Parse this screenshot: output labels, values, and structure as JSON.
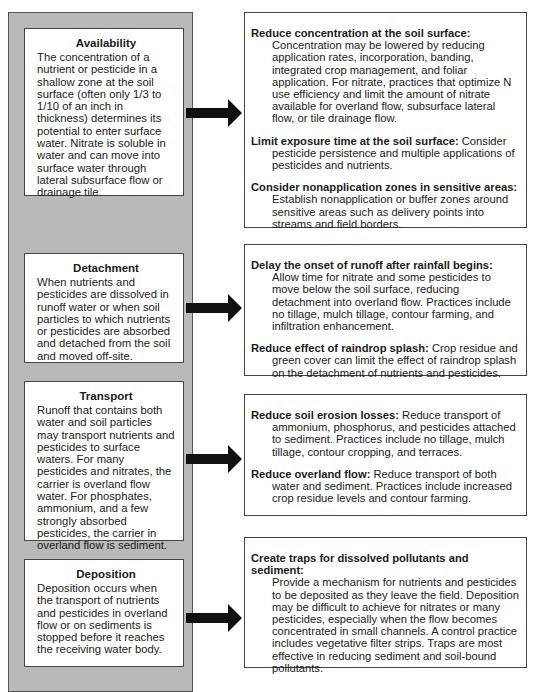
{
  "colors": {
    "column_gray": "#b9b9b9",
    "border": "#444444",
    "arrow": "#111111"
  },
  "left_boxes": [
    {
      "title": "Availability",
      "text": "The concentration of a nutrient or pesticide in a shallow zone at the soil surface (often only 1/3 to 1/10 of an inch in thickness) determines its potential to enter surface water. Nitrate is soluble in water and can move into surface water through lateral subsurface flow or drainage tile."
    },
    {
      "title": "Detachment",
      "text": "When nutrients and pesticides are dissolved in runoff water or when soil particles to which nutrients or pesticides are absorbed and detached from the soil and moved off-site."
    },
    {
      "title": "Transport",
      "text": "Runoff that contains both water and soil particles may transport nutrients and pesticides to surface waters. For many pesticides and nitrates, the carrier is overland flow  water. For phosphates, ammonium, and a few strongly absorbed pesticides, the carrier in overland flow is sediment."
    },
    {
      "title": "Deposition",
      "text": "Deposition occurs when the transport of nutrients and pesticides in overland flow or on sediments is stopped before it reaches the receiving water body."
    }
  ],
  "right_boxes": [
    {
      "items": [
        {
          "heading": "Reduce concentration at the soil surface:",
          "text": "Concentration may be lowered by reducing application rates, incorporation, banding, integrated crop management, and foliar application. For nitrate, practices that optimize N use efficiency and limit the amount of nitrate available for overland flow, subsurface lateral flow, or tile drainage flow."
        },
        {
          "heading": "Limit exposure time at the soil surface:",
          "text": "Consider pesticide persistence and multiple applications of pesticides and nutrients."
        },
        {
          "heading": "Consider nonapplication zones in sensitive areas:",
          "text": "Establish nonapplication or buffer zones around sensitive areas such as delivery points into streams and field borders."
        }
      ]
    },
    {
      "items": [
        {
          "heading": "Delay the onset of runoff after rainfall begins:",
          "text": "Allow time for nitrate and some pesticides to move below the soil surface, reducing detachment into overland flow. Practices include  no tillage, mulch tillage, contour farming, and infiltration enhancement."
        },
        {
          "heading": "Reduce effect of raindrop splash:",
          "text": "Crop residue and green cover can limit the effect of raindrop splash on the detachment of nutrients and pesticides."
        }
      ]
    },
    {
      "items": [
        {
          "heading": "Reduce soil erosion losses:",
          "text": "Reduce transport of ammonium, phosphorus, and pesticides attached to sediment. Practices include no tillage, mulch tillage, contour cropping, and terraces."
        },
        {
          "heading": "Reduce overland flow:",
          "text": "Reduce transport of both water and sediment. Practices include increased crop residue levels and contour farming."
        }
      ]
    },
    {
      "items": [
        {
          "heading": "Create traps for dissolved pollutants and sediment:",
          "text": "Provide a mechanism for nutrients and pesticides to be deposited as they leave the field. Deposition may be difficult to achieve for nitrates or many pesticides, especially when the flow becomes concentrated in small channels. A control practice includes vegetative filter strips. Traps are most effective in reducing sediment and soil-bound pollutants."
        }
      ]
    }
  ]
}
